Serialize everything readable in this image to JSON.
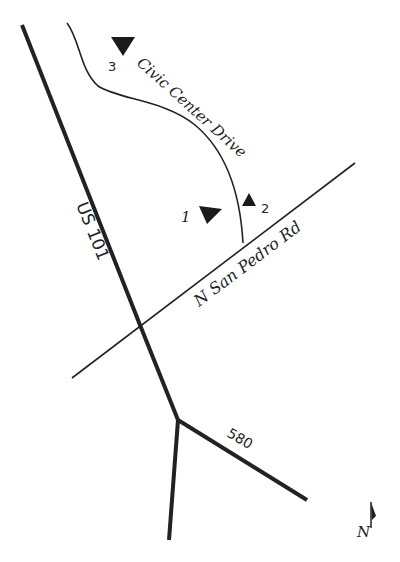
{
  "map": {
    "roads": {
      "us101": {
        "label": "US 101"
      },
      "civic_center": {
        "label": "Civic Center Drive"
      },
      "san_pedro": {
        "label": "N San Pedro Rd"
      },
      "i580": {
        "label": "580"
      }
    },
    "markers": [
      {
        "id": "1",
        "label": "1"
      },
      {
        "id": "2",
        "label": "2"
      },
      {
        "id": "3",
        "label": "3"
      }
    ],
    "north_arrow": {
      "label": "N"
    }
  }
}
